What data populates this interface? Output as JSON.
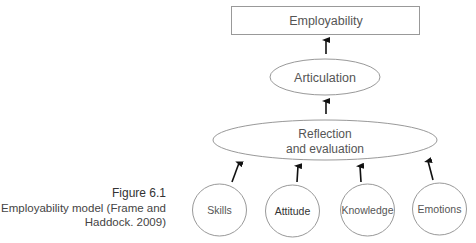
{
  "figure": {
    "number": "Figure 6.1",
    "caption_line1": "Employability model (Frame and",
    "caption_line2": "Haddock. 2009)"
  },
  "nodes": {
    "employability": "Employability",
    "articulation": "Articulation",
    "reflection_line1": "Reflection",
    "reflection_line2": "and evaluation",
    "skills": "Skills",
    "attitude": "Attitude",
    "knowledge": "Knowledge",
    "emotions": "Emotions"
  },
  "colors": {
    "stroke": "#999999",
    "arrow": "#111111",
    "text": "#555555"
  }
}
